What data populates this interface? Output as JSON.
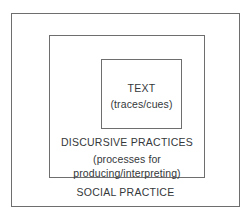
{
  "figure": {
    "type": "nested-boxes-diagram",
    "background_color": "#ffffff",
    "border_color": "#6e6e6e",
    "text_color": "#35383a"
  },
  "layers": {
    "outer": {
      "name": "social-practice",
      "label": "SOCIAL PRACTICE"
    },
    "middle": {
      "name": "discursive-practices",
      "label": "DISCURSIVE PRACTICES",
      "sub_line_1": "(processes for",
      "sub_line_2": "producing/interpreting)"
    },
    "inner": {
      "name": "text",
      "label": "TEXT",
      "sub_line_1": "(traces/cues)"
    }
  }
}
